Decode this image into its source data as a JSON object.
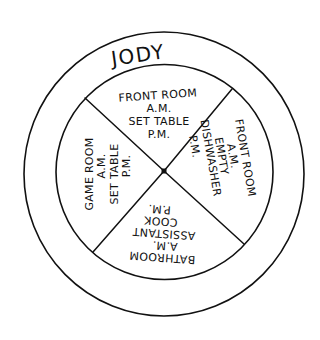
{
  "wheel": {
    "name": "JODY",
    "colors": {
      "ink": "#111111",
      "background": "#ffffff"
    },
    "sections": [
      {
        "position": "top",
        "lines": [
          "FRONT ROOM",
          "A.M.",
          "SET TABLE",
          "P.M."
        ]
      },
      {
        "position": "right",
        "lines": [
          "FRONT ROOM",
          "A.M.",
          "EMPTY",
          "DISHWASHER",
          "P.M."
        ]
      },
      {
        "position": "bottom",
        "lines": [
          "BATHROOM",
          "A.M.",
          "ASSISTANT",
          "COOK",
          "P.M."
        ]
      },
      {
        "position": "left",
        "lines": [
          "GAME ROOM",
          "A.M.",
          "SET TABLE",
          "P.M."
        ]
      }
    ]
  }
}
